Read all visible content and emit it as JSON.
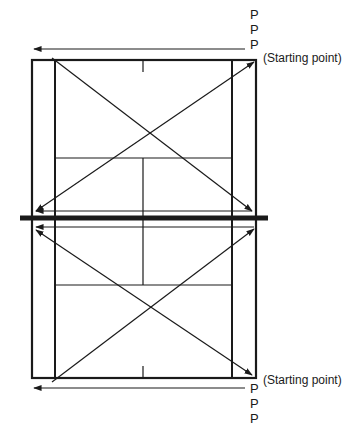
{
  "diagram": {
    "colors": {
      "line": "#1a1a1a",
      "background": "#ffffff"
    },
    "court": {
      "outer": {
        "x1": 32,
        "y1": 60,
        "x2": 256,
        "y2": 378
      },
      "alley_lines_x": [
        55,
        232
      ],
      "short_service_lines_y": [
        158,
        285
      ],
      "center_line_x": 143,
      "net": {
        "y": 218,
        "x1": 20,
        "x2": 268
      }
    },
    "top_group": {
      "players": [
        "P",
        "P",
        "P"
      ],
      "start_label": "(Starting point)"
    },
    "bottom_group": {
      "players": [
        "P",
        "P",
        "P"
      ],
      "start_label": "(Starting point)"
    },
    "paths": [
      {
        "name": "top-baseline-run",
        "from": [
          245,
          49
        ],
        "to": [
          34,
          49
        ],
        "heads": "end"
      },
      {
        "name": "top-diagonal-down",
        "from": [
          52,
          58
        ],
        "to": [
          252,
          211
        ],
        "heads": "end"
      },
      {
        "name": "top-diagonal-cross",
        "from": [
          36,
          211
        ],
        "to": [
          254,
          62
        ],
        "heads": "both"
      },
      {
        "name": "top-net-run",
        "from": [
          252,
          211
        ],
        "to": [
          36,
          211
        ],
        "heads": "end"
      },
      {
        "name": "bottom-net-run",
        "from": [
          254,
          227
        ],
        "to": [
          36,
          227
        ],
        "heads": "end"
      },
      {
        "name": "bottom-diagonal-cross",
        "from": [
          36,
          230
        ],
        "to": [
          252,
          375
        ],
        "heads": "both"
      },
      {
        "name": "bottom-diagonal-up",
        "from": [
          52,
          382
        ],
        "to": [
          254,
          229
        ],
        "heads": "end"
      },
      {
        "name": "bottom-baseline-run",
        "from": [
          245,
          388
        ],
        "to": [
          34,
          388
        ],
        "heads": "end"
      }
    ]
  }
}
